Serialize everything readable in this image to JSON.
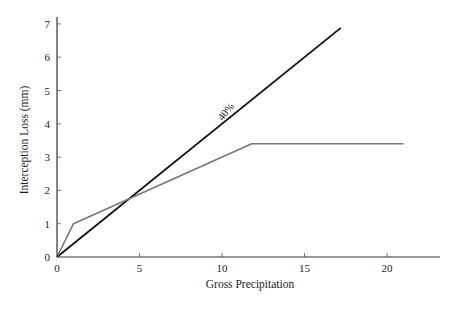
{
  "chart_data": {
    "type": "line",
    "title": "",
    "xlabel": "Gross Precipitation",
    "ylabel": "Interception Loss (mm)",
    "xlim": [
      0,
      23
    ],
    "ylim": [
      0,
      7.3
    ],
    "xticks": [
      0,
      5,
      10,
      15,
      20
    ],
    "yticks": [
      0,
      1,
      2,
      3,
      4,
      5,
      6,
      7
    ],
    "grid": false,
    "legend": null,
    "series": [
      {
        "name": "40% line",
        "color": "#111111",
        "x": [
          0,
          17.2
        ],
        "y": [
          0,
          6.88
        ]
      },
      {
        "name": "Interception loss",
        "color": "#777777",
        "x": [
          0,
          1,
          11.8,
          21
        ],
        "y": [
          0,
          1.0,
          3.4,
          3.4
        ]
      }
    ],
    "annotations": [
      {
        "text": "40%",
        "x": 10.4,
        "y": 4.3,
        "rotation": -51
      }
    ]
  }
}
